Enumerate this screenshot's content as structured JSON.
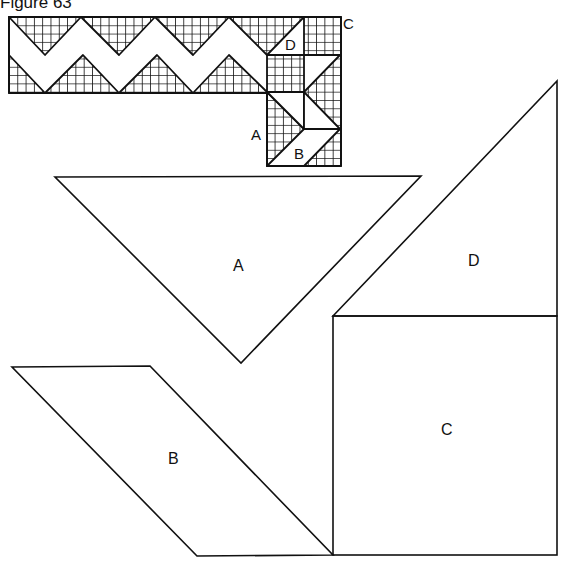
{
  "figure": {
    "title": "Figure 63",
    "block_labels": {
      "a": "A",
      "b": "B",
      "c": "C",
      "d": "D"
    },
    "pattern_labels": {
      "a": "A",
      "b": "B",
      "c": "C",
      "d": "D"
    },
    "colors": {
      "line": "#111111",
      "background": "#ffffff"
    }
  }
}
